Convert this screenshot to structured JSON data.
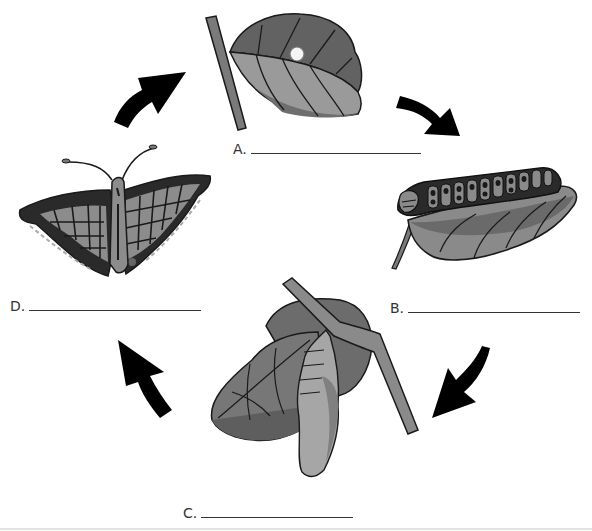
{
  "diagram": {
    "colors": {
      "outline": "#1a1a1a",
      "dark": "#555555",
      "mid": "#7a7a7a",
      "light": "#9c9c9c",
      "egg": "#f2f2f2",
      "arrow": "#000000"
    },
    "stages": [
      {
        "id": "A",
        "label": "A.",
        "depicts": "egg on leaf",
        "answer": ""
      },
      {
        "id": "B",
        "label": "B.",
        "depicts": "caterpillar on leaf",
        "answer": ""
      },
      {
        "id": "C",
        "label": "C.",
        "depicts": "chrysalis hanging from branch",
        "answer": ""
      },
      {
        "id": "D",
        "label": "D.",
        "depicts": "adult butterfly",
        "answer": ""
      }
    ],
    "arrows": [
      {
        "from": "D",
        "to": "A",
        "icon": "curved-arrow-up-right"
      },
      {
        "from": "A",
        "to": "B",
        "icon": "curved-arrow-down-right"
      },
      {
        "from": "B",
        "to": "C",
        "icon": "curved-arrow-down-left"
      },
      {
        "from": "C",
        "to": "D",
        "icon": "curved-arrow-up-left"
      }
    ]
  }
}
